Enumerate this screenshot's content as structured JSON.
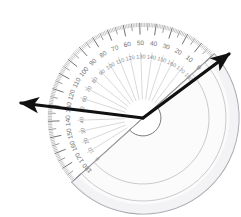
{
  "scene": {
    "title": "Protractor measuring an angle",
    "background_color": "#ffffff",
    "width": 241,
    "height": 217
  },
  "protractor": {
    "name": "semicircular-protractor",
    "center_x": 143,
    "center_y": 118,
    "outer_radius": 96,
    "inner_radius": 18,
    "rotation_degrees": 42,
    "body_color": "#fbfbfb",
    "edge_color": "#9a9a9f",
    "tick_color": "#58585c",
    "ray_color": "#b9b9be",
    "label_color": "#6e6e72",
    "outer_scale_labels": [
      "0",
      "10",
      "20",
      "30",
      "40",
      "50",
      "60",
      "70",
      "80",
      "90",
      "100",
      "110",
      "120",
      "130",
      "140",
      "150",
      "160",
      "170",
      "180"
    ],
    "inner_scale_labels": [
      "180",
      "170",
      "160",
      "150",
      "140",
      "130",
      "120",
      "110",
      "100",
      "90",
      "80",
      "70",
      "60",
      "50",
      "40",
      "30",
      "20",
      "10",
      "0"
    ],
    "major_tick_step_degrees": 10,
    "minor_tick_step_degrees": 1,
    "mid_tick_step_degrees": 5
  },
  "rays": [
    {
      "name": "ray-left",
      "label": "left arrow",
      "from_x": 143,
      "from_y": 118,
      "to_x": 21,
      "to_y": 103,
      "color": "#111111",
      "width": 3.2,
      "arrowhead": "end",
      "angle_degrees": 173
    },
    {
      "name": "ray-right",
      "label": "right arrow",
      "from_x": 143,
      "from_y": 118,
      "to_x": 229,
      "to_y": 54,
      "color": "#111111",
      "width": 3.2,
      "arrowhead": "end",
      "angle_degrees": 36.7
    }
  ],
  "chart_data": {
    "type": "diagram",
    "title": "Protractor measuring an angle",
    "xlabel": "",
    "ylabel": "",
    "measured_angle_degrees": 136,
    "annotations": [
      "Outer scale runs 0 to 180 counterclockwise",
      "Inner scale runs 180 to 0 counterclockwise",
      "Two black arrows emanate from the protractor origin"
    ]
  }
}
